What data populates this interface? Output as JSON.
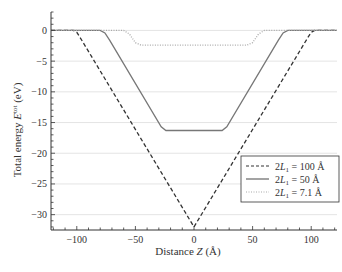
{
  "chart_data": {
    "type": "line",
    "title": "",
    "xlabel": "Distance Z (Å)",
    "ylabel": "Total energy E^tot (eV)",
    "xlim": [
      -122,
      122
    ],
    "ylim": [
      -32.5,
      3
    ],
    "xticks": [
      -100,
      -50,
      0,
      50,
      100
    ],
    "yticks": [
      0,
      -5,
      -10,
      -15,
      -20,
      -25,
      -30
    ],
    "xtick_labels": [
      "−100",
      "−50",
      "0",
      "50",
      "100"
    ],
    "ytick_labels": [
      "0",
      "−5",
      "−10",
      "−15",
      "−20",
      "−25",
      "−30"
    ],
    "grid": "horizontal",
    "legend_position": "lower right",
    "series": [
      {
        "name": "2L1 = 100 Å",
        "style": "dashed",
        "x": [
          -122,
          -103,
          -100,
          -97,
          0,
          97,
          100,
          103,
          122
        ],
        "y": [
          0,
          0,
          -0.3,
          -1.2,
          -32,
          -1.2,
          -0.3,
          0,
          0
        ]
      },
      {
        "name": "2L1 = 50 Å",
        "style": "solid",
        "x": [
          -122,
          -80,
          -76,
          -72,
          -28,
          -24,
          24,
          28,
          72,
          76,
          80,
          122
        ],
        "y": [
          0,
          0,
          -0.4,
          -1.6,
          -15.7,
          -16.3,
          -16.3,
          -15.7,
          -1.6,
          -0.4,
          0,
          0
        ]
      },
      {
        "name": "2L1 = 7.1 Å",
        "style": "dotted",
        "x": [
          -122,
          -60,
          -55,
          -50,
          -45,
          45,
          50,
          55,
          60,
          122
        ],
        "y": [
          0,
          0,
          -0.6,
          -2.0,
          -2.4,
          -2.4,
          -2.0,
          -0.6,
          0,
          0
        ]
      }
    ]
  },
  "legend": {
    "items": [
      {
        "prefix": "2",
        "var": "L",
        "sub": "1",
        "suffix": " = 100 Å"
      },
      {
        "prefix": "2",
        "var": "L",
        "sub": "1",
        "suffix": " = 50 Å"
      },
      {
        "prefix": "2",
        "var": "L",
        "sub": "1",
        "suffix": " = 7.1 Å"
      }
    ]
  },
  "axes": {
    "xlabel_pre": "Distance ",
    "xlabel_var": "Z",
    "xlabel_post": " (Å)",
    "ylabel_pre": "Total energy ",
    "ylabel_var": "E",
    "ylabel_sup": "tot",
    "ylabel_post": " (eV)"
  }
}
